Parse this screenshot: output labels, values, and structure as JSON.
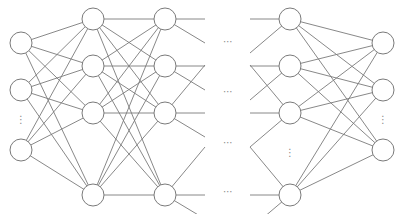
{
  "diagram": {
    "type": "neural-network",
    "colors": {
      "stroke": "#7a7a7a",
      "fill": "#ffffff",
      "ellipsis": "#8a8a8a"
    },
    "node_radius": 11,
    "layers": [
      {
        "name": "input-layer",
        "x": 21,
        "nodes_y": [
          43,
          90,
          150
        ],
        "vertical_ellipsis_y": 120
      },
      {
        "name": "hidden-layer-1",
        "x": 93,
        "nodes_y": [
          19,
          66,
          113,
          195
        ]
      },
      {
        "name": "hidden-layer-2",
        "x": 165,
        "nodes_y": [
          19,
          66,
          113,
          195
        ]
      },
      {
        "name": "hidden-layer-n",
        "x": 290,
        "nodes_y": [
          19,
          66,
          113,
          195
        ],
        "vertical_ellipsis_y": 153
      },
      {
        "name": "output-layer",
        "x": 383,
        "nodes_y": [
          43,
          90,
          150
        ],
        "vertical_ellipsis_y": 120
      }
    ],
    "horizontal_ellipsis": {
      "x": 228,
      "ys": [
        42,
        92,
        143,
        192
      ],
      "symbol": "⋯"
    },
    "vertical_ellipsis_symbol": "⋮"
  }
}
